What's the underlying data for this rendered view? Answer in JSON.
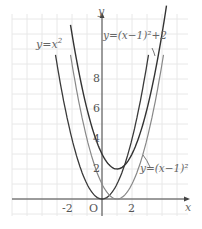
{
  "figure": {
    "axes": {
      "x_label": "x",
      "y_label": "y",
      "origin_label": "O"
    },
    "x_ticks": [
      "-2",
      "2"
    ],
    "y_ticks": [
      "2",
      "4",
      "6",
      "8"
    ],
    "curves": [
      {
        "label_y": "y",
        "label_eq": "=",
        "label_rest": "x",
        "label_sup": "2",
        "name": "y=x^2"
      },
      {
        "label": "y=(x−1)²",
        "name": "y=(x-1)^2"
      },
      {
        "label": "y=(x−1)²+2",
        "name": "y=(x-1)^2+2"
      }
    ],
    "colors": {
      "curve_dark": "#333333",
      "curve_light": "#777777",
      "grid": "#e6e6e6",
      "axis": "#444444"
    }
  },
  "chart_data": {
    "type": "line",
    "title": "",
    "xlabel": "x",
    "ylabel": "y",
    "xlim": [
      -6,
      5.5
    ],
    "ylim": [
      -1,
      12
    ],
    "grid": true,
    "series": [
      {
        "name": "y=x^2",
        "x": [
          -3,
          -2,
          -1,
          0,
          1,
          2,
          3
        ],
        "values": [
          9,
          4,
          1,
          0,
          1,
          4,
          9
        ]
      },
      {
        "name": "y=(x-1)^2",
        "x": [
          -2,
          -1,
          0,
          1,
          2,
          3,
          4
        ],
        "values": [
          9,
          4,
          1,
          0,
          1,
          4,
          9
        ]
      },
      {
        "name": "y=(x-1)^2+2",
        "x": [
          -2,
          -1,
          0,
          1,
          2,
          3,
          4
        ],
        "values": [
          11,
          6,
          3,
          2,
          3,
          6,
          11
        ]
      }
    ]
  }
}
